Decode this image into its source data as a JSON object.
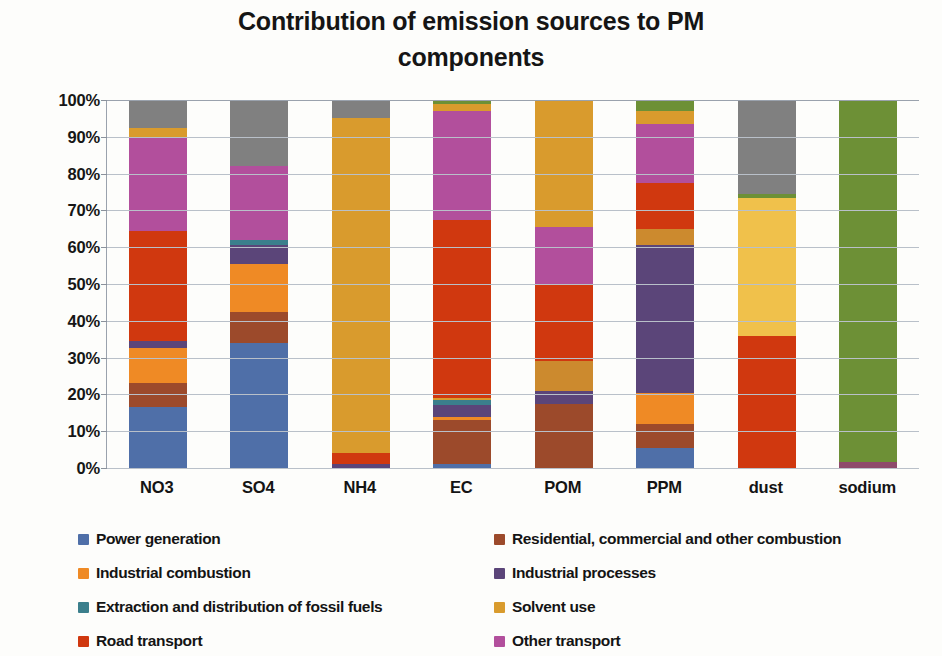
{
  "title": {
    "line1": "Contribution of emission sources to PM",
    "line2": "components"
  },
  "axes": {
    "y_ticks": [
      "100%",
      "90%",
      "80%",
      "70%",
      "60%",
      "50%",
      "40%",
      "30%",
      "20%",
      "10%",
      "0%"
    ],
    "x_labels": [
      "NO3",
      "SO4",
      "NH4",
      "EC",
      "POM",
      "PPM",
      "dust",
      "sodium"
    ]
  },
  "legend": {
    "items": [
      {
        "label": "Power generation",
        "color": "#4f6fa8"
      },
      {
        "label": "Residential, commercial and other combustion",
        "color": "#9c4a2b"
      },
      {
        "label": "Industrial combustion",
        "color": "#ef8a25"
      },
      {
        "label": "Industrial processes",
        "color": "#5b4579"
      },
      {
        "label": "Extraction and distribution of fossil fuels",
        "color": "#3b7f8c"
      },
      {
        "label": "Solvent use",
        "color": "#d99b2d"
      },
      {
        "label": "Road transport",
        "color": "#d0380f"
      },
      {
        "label": "Other transport",
        "color": "#b24f9c"
      }
    ]
  },
  "chart_data": {
    "type": "bar",
    "subtype": "stacked-100-percent",
    "title": "Contribution of emission sources to PM components",
    "xlabel": "",
    "ylabel": "",
    "ylim": [
      0,
      100
    ],
    "ytick_step": 10,
    "grid": true,
    "legend_position": "bottom",
    "categories": [
      "NO3",
      "SO4",
      "NH4",
      "EC",
      "POM",
      "PPM",
      "dust",
      "sodium"
    ],
    "series": [
      {
        "name": "Power generation",
        "color": "#4f6fa8",
        "values": [
          16.5,
          34.0,
          0.0,
          1.0,
          0.0,
          5.5,
          0.0,
          0.0
        ]
      },
      {
        "name": "Residential, commercial and other combustion",
        "color": "#9c4a2b",
        "values": [
          6.5,
          8.5,
          0.0,
          12.0,
          17.5,
          6.5,
          0.0,
          0.0
        ]
      },
      {
        "name": "Industrial combustion",
        "color": "#ef8a25",
        "values": [
          9.5,
          13.0,
          0.0,
          1.0,
          0.0,
          8.5,
          0.0,
          0.0
        ]
      },
      {
        "name": "Industrial processes",
        "color": "#5b4579",
        "values": [
          2.0,
          5.0,
          1.0,
          3.0,
          3.5,
          40.0,
          0.0,
          0.0
        ]
      },
      {
        "name": "Extraction and distribution of fossil fuels",
        "color": "#3b7f8c",
        "values": [
          0.0,
          1.5,
          0.0,
          1.5,
          0.0,
          0.0,
          0.0,
          0.0
        ]
      },
      {
        "name": "Solvent use",
        "color": "#d99b2d",
        "values": [
          0.0,
          0.0,
          91.0,
          0.5,
          8.0,
          4.5,
          37.5,
          0.0
        ]
      },
      {
        "name": "Road transport",
        "color": "#d0380f",
        "values": [
          30.0,
          0.0,
          3.0,
          48.5,
          21.0,
          12.5,
          36.0,
          0.0
        ]
      },
      {
        "name": "Other transport",
        "color": "#b24f9c",
        "values": [
          25.5,
          20.0,
          0.0,
          29.0,
          15.5,
          16.0,
          0.0,
          1.5
        ]
      },
      {
        "name": "Solvent use (upper)",
        "color": "#d99b2d",
        "values": [
          2.5,
          0.0,
          0.0,
          1.5,
          34.5,
          3.5,
          0.0,
          0.0
        ]
      },
      {
        "name": "Agriculture / natural",
        "color": "#6d9036",
        "values": [
          0.0,
          0.0,
          0.0,
          1.0,
          0.0,
          3.0,
          1.0,
          98.5
        ]
      },
      {
        "name": "Other sources",
        "color": "#808080",
        "values": [
          7.5,
          18.0,
          4.5,
          0.5,
          0.0,
          0.0,
          25.5,
          0.0
        ]
      }
    ],
    "stack_order": [
      [
        "#4f6fa8",
        16.5
      ],
      [
        "#9c4a2b",
        6.5
      ],
      [
        "#ef8a25",
        9.5
      ],
      [
        "#5b4579",
        2.0
      ],
      [
        "#d0380f",
        30.0
      ],
      [
        "#b24f9c",
        25.5
      ],
      [
        "#d99b2d",
        2.5
      ],
      [
        "#808080",
        7.5
      ]
    ],
    "stacks": [
      {
        "category": "NO3",
        "segments": [
          {
            "source": "Power generation",
            "color": "#4f6fa8",
            "value": 16.5
          },
          {
            "source": "Residential, commercial and other combustion",
            "color": "#9c4a2b",
            "value": 6.5
          },
          {
            "source": "Industrial combustion",
            "color": "#ef8a25",
            "value": 9.5
          },
          {
            "source": "Industrial processes",
            "color": "#5b4579",
            "value": 2.0
          },
          {
            "source": "Road transport",
            "color": "#d0380f",
            "value": 30.0
          },
          {
            "source": "Other transport",
            "color": "#b24f9c",
            "value": 25.5
          },
          {
            "source": "Solvent use",
            "color": "#d99b2d",
            "value": 2.5
          },
          {
            "source": "Other sources",
            "color": "#808080",
            "value": 7.5
          }
        ]
      },
      {
        "category": "SO4",
        "segments": [
          {
            "source": "Power generation",
            "color": "#4f6fa8",
            "value": 34.0
          },
          {
            "source": "Residential, commercial and other combustion",
            "color": "#9c4a2b",
            "value": 8.5
          },
          {
            "source": "Industrial combustion",
            "color": "#ef8a25",
            "value": 13.0
          },
          {
            "source": "Industrial processes",
            "color": "#5b4579",
            "value": 5.0
          },
          {
            "source": "Extraction and distribution of fossil fuels",
            "color": "#3b7f8c",
            "value": 1.5
          },
          {
            "source": "Other transport",
            "color": "#b24f9c",
            "value": 20.0
          },
          {
            "source": "Other sources",
            "color": "#808080",
            "value": 18.0
          }
        ]
      },
      {
        "category": "NH4",
        "segments": [
          {
            "source": "Industrial processes",
            "color": "#5b4579",
            "value": 1.0
          },
          {
            "source": "Road transport",
            "color": "#d0380f",
            "value": 3.0
          },
          {
            "source": "Solvent use",
            "color": "#d99b2d",
            "value": 91.0
          },
          {
            "source": "Other sources",
            "color": "#808080",
            "value": 5.0
          }
        ]
      },
      {
        "category": "EC",
        "segments": [
          {
            "source": "Power generation",
            "color": "#4f6fa8",
            "value": 1.0
          },
          {
            "source": "Residential, commercial and other combustion",
            "color": "#9c4a2b",
            "value": 12.0
          },
          {
            "source": "Industrial combustion",
            "color": "#ef8a25",
            "value": 1.0
          },
          {
            "source": "Industrial processes",
            "color": "#5b4579",
            "value": 3.0
          },
          {
            "source": "Extraction and distribution of fossil fuels",
            "color": "#3b7f8c",
            "value": 1.5
          },
          {
            "source": "Solvent use",
            "color": "#d99b2d",
            "value": 0.5
          },
          {
            "source": "Road transport",
            "color": "#d0380f",
            "value": 48.5
          },
          {
            "source": "Other transport",
            "color": "#b24f9c",
            "value": 29.5
          },
          {
            "source": "Solvent use",
            "color": "#d99b2d",
            "value": 2.0
          },
          {
            "source": "Agriculture / natural",
            "color": "#6d9036",
            "value": 1.0
          }
        ]
      },
      {
        "category": "POM",
        "segments": [
          {
            "source": "Residential, commercial and other combustion",
            "color": "#9c4a2b",
            "value": 17.5
          },
          {
            "source": "Industrial processes",
            "color": "#5b4579",
            "value": 3.5
          },
          {
            "source": "Solvent use",
            "color": "#cc8a2e",
            "value": 8.0
          },
          {
            "source": "Road transport",
            "color": "#d0380f",
            "value": 21.0
          },
          {
            "source": "Other transport",
            "color": "#b24f9c",
            "value": 15.5
          },
          {
            "source": "Solvent use",
            "color": "#d99b2d",
            "value": 34.5
          }
        ]
      },
      {
        "category": "PPM",
        "segments": [
          {
            "source": "Power generation",
            "color": "#4f6fa8",
            "value": 5.5
          },
          {
            "source": "Residential, commercial and other combustion",
            "color": "#9c4a2b",
            "value": 6.5
          },
          {
            "source": "Industrial combustion",
            "color": "#ef8a25",
            "value": 8.5
          },
          {
            "source": "Industrial processes",
            "color": "#5b4579",
            "value": 40.0
          },
          {
            "source": "Solvent use",
            "color": "#cc8a2e",
            "value": 4.5
          },
          {
            "source": "Road transport",
            "color": "#d0380f",
            "value": 12.5
          },
          {
            "source": "Other transport",
            "color": "#b24f9c",
            "value": 16.0
          },
          {
            "source": "Solvent use",
            "color": "#d99b2d",
            "value": 3.5
          },
          {
            "source": "Agriculture / natural",
            "color": "#6d9036",
            "value": 3.0
          }
        ]
      },
      {
        "category": "dust",
        "segments": [
          {
            "source": "Road transport",
            "color": "#d0380f",
            "value": 36.0
          },
          {
            "source": "Solvent use",
            "color": "#f0c14b",
            "value": 37.5
          },
          {
            "source": "Agriculture / natural",
            "color": "#6d9036",
            "value": 1.0
          },
          {
            "source": "Other sources",
            "color": "#808080",
            "value": 25.5
          }
        ]
      },
      {
        "category": "sodium",
        "segments": [
          {
            "source": "Other transport",
            "color": "#8e4a6b",
            "value": 1.5
          },
          {
            "source": "Agriculture / natural",
            "color": "#6d9036",
            "value": 98.5
          }
        ]
      }
    ]
  }
}
